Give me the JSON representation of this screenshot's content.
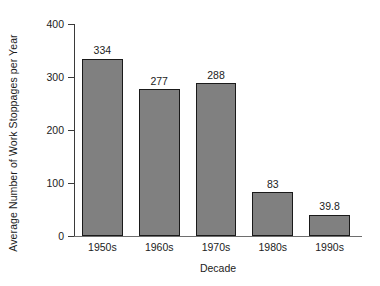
{
  "chart_data": {
    "type": "bar",
    "title": "",
    "categories": [
      "1950s",
      "1960s",
      "1970s",
      "1980s",
      "1990s"
    ],
    "values": [
      334,
      277,
      288,
      83,
      39.8
    ],
    "value_labels": [
      "334",
      "277",
      "288",
      "83",
      "39.8"
    ],
    "xlabel": "Decade",
    "ylabel": "Average Number of Work Stoppages per Year",
    "ylim": [
      0,
      400
    ],
    "yticks": [
      0,
      100,
      200,
      300,
      400
    ],
    "ytick_labels": [
      "0",
      "100",
      "200",
      "300",
      "400"
    ],
    "grid": false,
    "legend": false,
    "bar_fill_color": "#808080",
    "bar_edge_color": "#1a1a1a",
    "background_color": "#ffffff",
    "axis_color": "#3a3a3a"
  }
}
